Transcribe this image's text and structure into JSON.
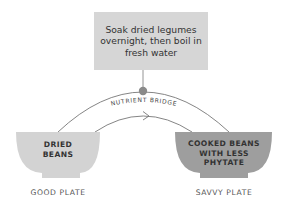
{
  "step": {
    "text": "Soak dried legumes overnight, then boil in fresh water",
    "color": "#d6d6d6"
  },
  "bridge": {
    "label": "NUTRIENT BRIDGE",
    "dot_color": "#8a8a8a",
    "line_color": "#777777"
  },
  "bowls": [
    {
      "label_lines": [
        "DRIED",
        "BEANS"
      ],
      "plate_label": "GOOD PLATE",
      "color": "#d3d3d3"
    },
    {
      "label_lines": [
        "COOKED BEANS",
        "WITH LESS",
        "PHYTATE"
      ],
      "plate_label": "SAVVY PLATE",
      "color": "#9e9e9e"
    }
  ]
}
